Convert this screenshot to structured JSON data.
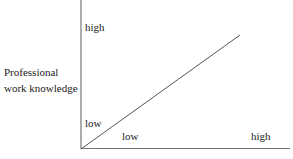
{
  "diagram": {
    "y_axis": {
      "title_line1": "Professional",
      "title_line2": "work knowledge",
      "high_label": "high",
      "low_label": "low"
    },
    "x_axis": {
      "low_label": "low",
      "high_label": "high"
    },
    "line": {
      "from": [
        81,
        149
      ],
      "to": [
        240,
        35
      ],
      "color": "#555555"
    },
    "axis_color": "#777777"
  }
}
